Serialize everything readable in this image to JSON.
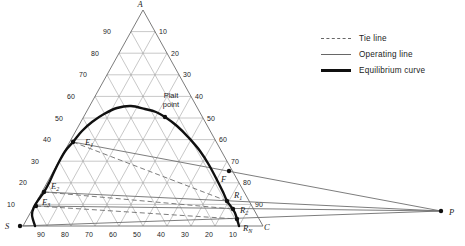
{
  "legend": {
    "items": [
      {
        "name": "tie-line",
        "label": "Tie line",
        "style": "dashed"
      },
      {
        "name": "operating-line",
        "label": "Operating line",
        "style": "thin"
      },
      {
        "name": "equilibrium-curve",
        "label": "Equilibrium curve",
        "style": "thick"
      }
    ]
  },
  "chart_data": {
    "type": "ternary-phase-diagram",
    "colors": {
      "grid": "#9a9a9a",
      "edge": "#5a5a5a",
      "operating": "#6e6e6e",
      "tie": "#6e6e6e",
      "curve": "#101010",
      "text": "#1c1c1c"
    },
    "triangle": {
      "apex": [
        143,
        10
      ],
      "bottom_left": [
        23,
        226
      ],
      "bottom_right": [
        263,
        226
      ],
      "grid_step_percent": 10
    },
    "axis_ticks": {
      "left": [
        90,
        80,
        70,
        60,
        50,
        40,
        30,
        20,
        10
      ],
      "right": [
        10,
        20,
        30,
        40,
        50,
        60,
        70,
        80,
        90
      ],
      "bottom": [
        90,
        80,
        70,
        60,
        50,
        40,
        30,
        20,
        10
      ]
    },
    "equilibrium_curve": [
      [
        35,
        226
      ],
      [
        32,
        215
      ],
      [
        34,
        207
      ],
      [
        39,
        199
      ],
      [
        44,
        192
      ],
      [
        49,
        183
      ],
      [
        54,
        172
      ],
      [
        60,
        160
      ],
      [
        66,
        150
      ],
      [
        73,
        142
      ],
      [
        82,
        131
      ],
      [
        92,
        122
      ],
      [
        104,
        114
      ],
      [
        117,
        108
      ],
      [
        131,
        106
      ],
      [
        145,
        109
      ],
      [
        156,
        112
      ],
      [
        165,
        117
      ],
      [
        177,
        126
      ],
      [
        189,
        138
      ],
      [
        200,
        151
      ],
      [
        209,
        165
      ],
      [
        217,
        180
      ],
      [
        223,
        192
      ],
      [
        227,
        201
      ],
      [
        232,
        208
      ],
      [
        235,
        213
      ],
      [
        237,
        219
      ],
      [
        239,
        226
      ]
    ],
    "operating_lines": [
      {
        "from": [
          73,
          142
        ],
        "to": [
          441,
          211
        ]
      },
      {
        "from": [
          44,
          192
        ],
        "to": [
          441,
          211
        ]
      },
      {
        "from": [
          36,
          206
        ],
        "to": [
          441,
          211
        ]
      },
      {
        "from": [
          20,
          226
        ],
        "to": [
          441,
          211
        ]
      }
    ],
    "tie_lines": [
      {
        "from": [
          73,
          142
        ],
        "to": [
          227,
          201
        ]
      },
      {
        "from": [
          44,
          192
        ],
        "to": [
          233,
          209
        ]
      },
      {
        "from": [
          36,
          206
        ],
        "to": [
          237,
          219
        ]
      }
    ],
    "points": [
      {
        "id": "A",
        "main": "A",
        "sub": "",
        "dot": null,
        "label": [
          140,
          7
        ],
        "anchor": "middle"
      },
      {
        "id": "S",
        "main": "S",
        "sub": "",
        "dot": [
          20,
          226
        ],
        "label": [
          5,
          229
        ],
        "anchor": "start"
      },
      {
        "id": "C",
        "main": "C",
        "sub": "",
        "dot": null,
        "label": [
          264,
          230
        ],
        "anchor": "start"
      },
      {
        "id": "P",
        "main": "P",
        "sub": "",
        "dot": [
          441,
          211
        ],
        "label": [
          449,
          215
        ],
        "anchor": "start"
      },
      {
        "id": "F",
        "main": "F",
        "sub": "",
        "dot": [
          229,
          171
        ],
        "label": [
          221,
          182
        ],
        "anchor": "start"
      },
      {
        "id": "E1",
        "main": "E",
        "sub": "1",
        "dot": [
          73,
          142
        ],
        "label": [
          85,
          145
        ],
        "anchor": "start"
      },
      {
        "id": "E2",
        "main": "E",
        "sub": "2",
        "dot": [
          44,
          192
        ],
        "label": [
          51,
          189
        ],
        "anchor": "start"
      },
      {
        "id": "E3",
        "main": "E",
        "sub": "3",
        "dot": [
          36,
          206
        ],
        "label": [
          42,
          205
        ],
        "anchor": "start"
      },
      {
        "id": "R1",
        "main": "R",
        "sub": "1",
        "dot": [
          227,
          201
        ],
        "label": [
          234,
          198
        ],
        "anchor": "start"
      },
      {
        "id": "R2",
        "main": "R",
        "sub": "2",
        "dot": [
          233,
          209
        ],
        "label": [
          240,
          213
        ],
        "anchor": "start"
      },
      {
        "id": "RN",
        "main": "R",
        "sub": "N",
        "dot": [
          237,
          219
        ],
        "label": [
          243,
          231
        ],
        "anchor": "start"
      },
      {
        "id": "plait",
        "main": "",
        "sub": "",
        "dot": [
          165,
          117
        ],
        "label": [
          171,
          98
        ],
        "anchor": "middle"
      }
    ],
    "plait_label": {
      "lines": [
        "Plait",
        "point"
      ],
      "x": 171,
      "y": 98,
      "line_height": 9
    }
  }
}
